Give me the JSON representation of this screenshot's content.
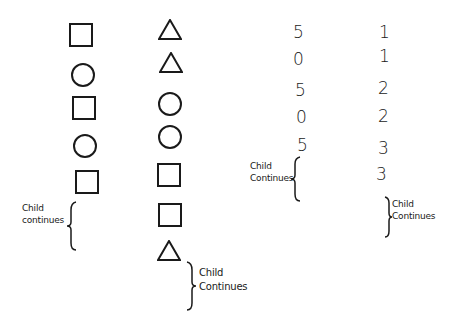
{
  "columns": [
    {
      "name": "shape-sequence-1",
      "items": [
        "square",
        "circle",
        "square",
        "circle",
        "square"
      ],
      "note": {
        "line1": "Child",
        "line2": "continues"
      }
    },
    {
      "name": "shape-sequence-2",
      "items": [
        "triangle",
        "triangle",
        "circle",
        "circle",
        "square",
        "square",
        "triangle"
      ],
      "note": {
        "line1": "Child",
        "line2": "Continues"
      }
    },
    {
      "name": "number-sequence-1",
      "items": [
        "5",
        "0",
        "5",
        "0",
        "5"
      ],
      "note": {
        "line1": "Child",
        "line2": "Continues"
      }
    },
    {
      "name": "number-sequence-2",
      "items": [
        "1",
        "1",
        "2",
        "2",
        "3",
        "3"
      ],
      "note": {
        "line1": "Child",
        "line2": "Continues"
      }
    }
  ]
}
